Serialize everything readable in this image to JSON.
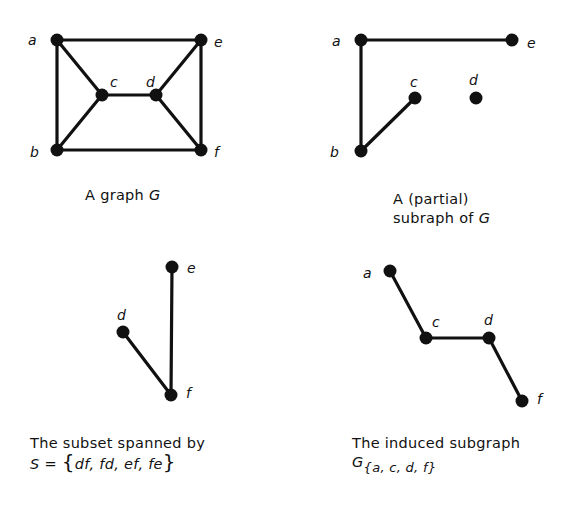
{
  "panels": [
    {
      "id": "graph-G",
      "caption": {
        "line1_prefix": "A graph",
        "line1_symbol": "G"
      },
      "nodes": [
        {
          "id": "a",
          "x": 57,
          "y": 40,
          "lx": 28,
          "ly": 45
        },
        {
          "id": "e",
          "x": 201,
          "y": 40,
          "lx": 214,
          "ly": 47
        },
        {
          "id": "c",
          "x": 102,
          "y": 95,
          "lx": 110,
          "ly": 87
        },
        {
          "id": "d",
          "x": 156,
          "y": 95,
          "lx": 146,
          "ly": 87
        },
        {
          "id": "b",
          "x": 57,
          "y": 150,
          "lx": 30,
          "ly": 157
        },
        {
          "id": "f",
          "x": 201,
          "y": 150,
          "lx": 214,
          "ly": 157
        }
      ],
      "edges": [
        [
          "a",
          "e"
        ],
        [
          "a",
          "b"
        ],
        [
          "a",
          "c"
        ],
        [
          "b",
          "c"
        ],
        [
          "c",
          "d"
        ],
        [
          "d",
          "e"
        ],
        [
          "d",
          "f"
        ],
        [
          "e",
          "f"
        ],
        [
          "b",
          "f"
        ]
      ]
    },
    {
      "id": "partial-subgraph",
      "caption": {
        "line1": "A (partial)",
        "line2_prefix": "subraph of",
        "line2_symbol": "G"
      },
      "nodes": [
        {
          "id": "a",
          "x": 361,
          "y": 40,
          "lx": 332,
          "ly": 46
        },
        {
          "id": "e",
          "x": 512,
          "y": 40,
          "lx": 527,
          "ly": 48
        },
        {
          "id": "c",
          "x": 415,
          "y": 98,
          "lx": 410,
          "ly": 87
        },
        {
          "id": "d",
          "x": 476,
          "y": 98,
          "lx": 469,
          "ly": 85
        },
        {
          "id": "b",
          "x": 361,
          "y": 151,
          "lx": 330,
          "ly": 157
        }
      ],
      "edges": [
        [
          "a",
          "e"
        ],
        [
          "a",
          "b"
        ],
        [
          "b",
          "c"
        ]
      ]
    },
    {
      "id": "spanned-subset",
      "caption": {
        "line1": "The subset spanned by",
        "line2": "S = {df, fd, ef, fe}"
      },
      "nodes": [
        {
          "id": "e",
          "x": 172,
          "y": 267,
          "lx": 187,
          "ly": 273
        },
        {
          "id": "d",
          "x": 123,
          "y": 332,
          "lx": 117,
          "ly": 320
        },
        {
          "id": "f",
          "x": 171,
          "y": 395,
          "lx": 186,
          "ly": 398
        }
      ],
      "edges": [
        [
          "e",
          "f"
        ],
        [
          "d",
          "f"
        ]
      ]
    },
    {
      "id": "induced-subgraph",
      "caption": {
        "line1": "The induced subgraph",
        "line2_symbol": "G",
        "line2_subscript": "{a, c, d, f}"
      },
      "nodes": [
        {
          "id": "a",
          "x": 390,
          "y": 271,
          "lx": 363,
          "ly": 278
        },
        {
          "id": "c",
          "x": 426,
          "y": 338,
          "lx": 432,
          "ly": 327
        },
        {
          "id": "d",
          "x": 489,
          "y": 338,
          "lx": 484,
          "ly": 325
        },
        {
          "id": "f",
          "x": 522,
          "y": 401,
          "lx": 537,
          "ly": 404
        }
      ],
      "edges": [
        [
          "a",
          "c"
        ],
        [
          "c",
          "d"
        ],
        [
          "d",
          "f"
        ]
      ]
    }
  ],
  "captions": {
    "p1_text": "A graph ",
    "p1_sym": "G",
    "p2_line1": "A (partial)",
    "p2_line2_text": "subraph of ",
    "p2_line2_sym": "G",
    "p3_line1": "The subset spanned by",
    "p3_S": "S",
    "p3_eq": " = ",
    "p3_lbrace": "{",
    "p3_set": "df, fd, ef, fe",
    "p3_rbrace": "}",
    "p4_line1": "The induced subgraph",
    "p4_sym": "G",
    "p4_lbrace": "{",
    "p4_set": "a, c, d, f",
    "p4_rbrace": "}"
  }
}
